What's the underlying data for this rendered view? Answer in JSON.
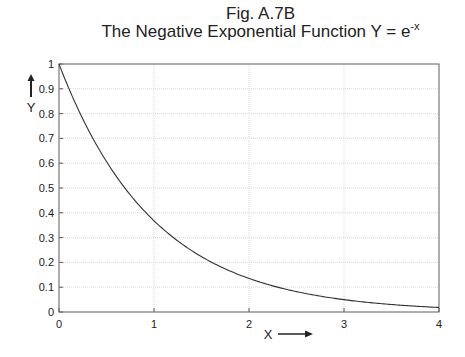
{
  "chart_data": {
    "type": "line",
    "title": "Fig. A.7B",
    "subtitle": "The Negative Exponential Function Y = e^-x",
    "subtitle_base": "The Negative Exponential Function Y = e",
    "subtitle_exponent": "-x",
    "xlabel": "X",
    "ylabel": "Y",
    "xlim": [
      0,
      4
    ],
    "ylim": [
      0,
      1
    ],
    "x_ticks": [
      "0",
      "1",
      "2",
      "3",
      "4"
    ],
    "y_ticks": [
      "0",
      "0.1",
      "0.2",
      "0.3",
      "0.4",
      "0.5",
      "0.6",
      "0.7",
      "0.8",
      "0.9",
      "1"
    ],
    "grid": true,
    "legend": null,
    "series": [
      {
        "name": "Y = e^-x",
        "x": [
          0,
          0.25,
          0.5,
          0.75,
          1,
          1.25,
          1.5,
          1.75,
          2,
          2.25,
          2.5,
          2.75,
          3,
          3.25,
          3.5,
          3.75,
          4
        ],
        "y": [
          1,
          0.779,
          0.607,
          0.472,
          0.368,
          0.287,
          0.223,
          0.174,
          0.135,
          0.105,
          0.082,
          0.064,
          0.05,
          0.039,
          0.03,
          0.024,
          0.018
        ]
      }
    ]
  }
}
